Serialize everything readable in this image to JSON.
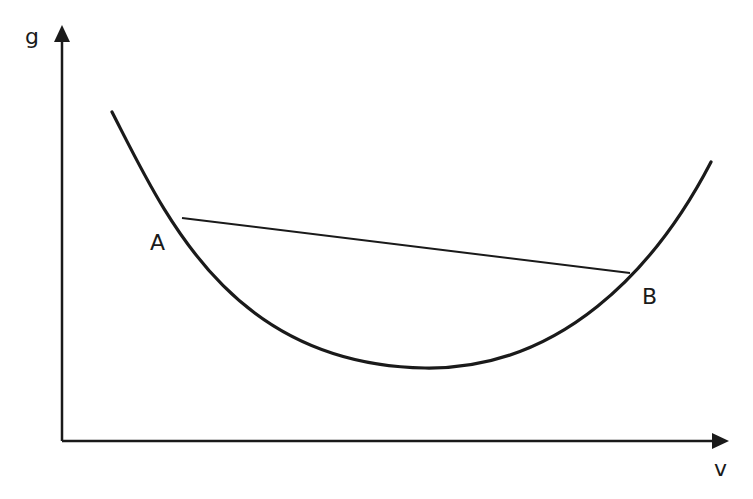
{
  "diagram": {
    "type": "convex-curve-with-chord",
    "axes": {
      "y_label": "g",
      "x_label": "v"
    },
    "points": [
      {
        "id": "A",
        "label": "A"
      },
      {
        "id": "B",
        "label": "B"
      }
    ],
    "colors": {
      "stroke": "#1a1a1a",
      "background": "#ffffff"
    }
  }
}
